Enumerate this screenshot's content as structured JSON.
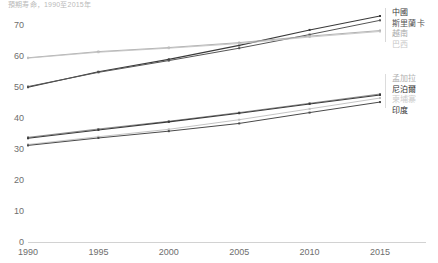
{
  "chart_data": {
    "type": "line",
    "title": "預期寿命，1990至2015年",
    "xlabel": "",
    "ylabel": "",
    "x": [
      1990,
      1995,
      2000,
      2005,
      2010,
      2015
    ],
    "xlim": [
      1990,
      2015
    ],
    "ylim": [
      0,
      73
    ],
    "yticks": [
      0,
      10,
      20,
      30,
      40,
      50,
      60,
      70
    ],
    "xticks": [
      1990,
      1995,
      2000,
      2005,
      2010,
      2015
    ],
    "grid": false,
    "legend_position": "right",
    "series": [
      {
        "name": "中國",
        "values": [
          50.0,
          55.0,
          59.0,
          63.5,
          68.5,
          73.0
        ],
        "color": "#3a3a3a",
        "width": 1.1
      },
      {
        "name": "斯里蘭卡",
        "values": [
          50.2,
          54.8,
          58.6,
          62.6,
          67.0,
          71.6
        ],
        "color": "#555555",
        "width": 1.0
      },
      {
        "name": "越南",
        "values": [
          59.5,
          61.5,
          62.8,
          64.4,
          66.5,
          68.3
        ],
        "color": "#a8a8a8",
        "width": 0.9
      },
      {
        "name": "巴西",
        "values": [
          59.4,
          61.3,
          62.6,
          64.1,
          66.2,
          68.0
        ],
        "color": "#c2c2c2",
        "width": 0.9
      },
      {
        "name": "孟加拉",
        "values": [
          33.8,
          36.5,
          39.0,
          41.8,
          44.8,
          47.8
        ],
        "color": "#7d7d7d",
        "width": 0.9
      },
      {
        "name": "尼泊爾",
        "values": [
          33.5,
          36.2,
          38.8,
          41.6,
          44.6,
          47.5
        ],
        "color": "#3a3a3a",
        "width": 1.1
      },
      {
        "name": "柬埔寨",
        "values": [
          31.5,
          34.0,
          36.4,
          39.5,
          43.0,
          46.5
        ],
        "color": "#bdbdbd",
        "width": 0.9
      },
      {
        "name": "印度",
        "values": [
          31.2,
          33.6,
          35.8,
          38.3,
          41.8,
          45.2
        ],
        "color": "#4a4a4a",
        "width": 1.0
      }
    ]
  },
  "legend": {
    "top_group": [
      "中國",
      "斯里蘭卡",
      "越南",
      "巴西"
    ],
    "bottom_group": [
      "孟加拉",
      "尼泊爾",
      "柬埔寨",
      "印度"
    ]
  },
  "legend_colors": {
    "top_group": [
      "#3a3a3a",
      "#555555",
      "#a8a8a8",
      "#c8c8c8"
    ],
    "bottom_group": [
      "#b0b0b0",
      "#2f2f2f",
      "#cccccc",
      "#2f2f2f"
    ]
  }
}
